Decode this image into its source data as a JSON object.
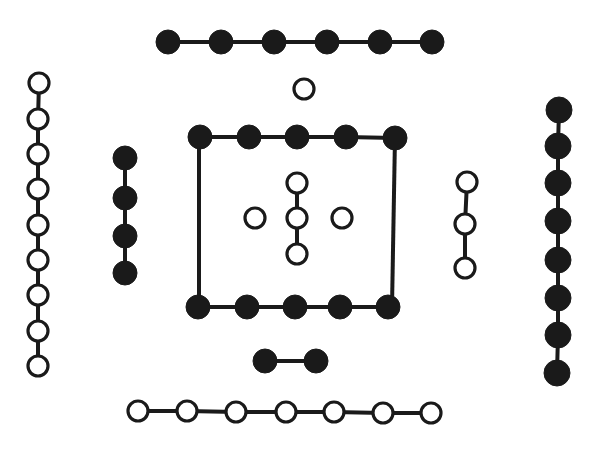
{
  "diagram": {
    "title": "",
    "style": {
      "ink": "#1a1a1a",
      "paper": "#ffffff"
    },
    "groups": [
      {
        "id": "top-row",
        "count": 6,
        "fill": "black",
        "orientation": "horizontal",
        "connected": true,
        "points": [
          [
            168,
            42
          ],
          [
            221,
            42
          ],
          [
            274,
            42
          ],
          [
            327,
            42
          ],
          [
            380,
            42
          ],
          [
            432,
            42
          ]
        ],
        "r": 12
      },
      {
        "id": "top-single",
        "count": 1,
        "fill": "white",
        "orientation": "single",
        "connected": false,
        "points": [
          [
            304,
            89
          ]
        ],
        "r": 10
      },
      {
        "id": "left-column",
        "count": 9,
        "fill": "white",
        "orientation": "vertical",
        "connected": true,
        "points": [
          [
            39,
            83
          ],
          [
            38,
            119
          ],
          [
            38,
            154
          ],
          [
            38,
            189
          ],
          [
            38,
            225
          ],
          [
            38,
            260
          ],
          [
            38,
            295
          ],
          [
            38,
            331
          ],
          [
            38,
            366
          ]
        ],
        "r": 10
      },
      {
        "id": "right-column",
        "count": 8,
        "fill": "black",
        "orientation": "vertical",
        "connected": true,
        "points": [
          [
            559,
            110
          ],
          [
            558,
            146
          ],
          [
            558,
            183
          ],
          [
            558,
            221
          ],
          [
            558,
            260
          ],
          [
            558,
            298
          ],
          [
            558,
            335
          ],
          [
            557,
            373
          ]
        ],
        "r": 13
      },
      {
        "id": "inner-left-column",
        "count": 4,
        "fill": "black",
        "orientation": "vertical",
        "connected": true,
        "points": [
          [
            125,
            158
          ],
          [
            125,
            198
          ],
          [
            125,
            236
          ],
          [
            125,
            273
          ]
        ],
        "r": 12
      },
      {
        "id": "inner-right-column",
        "count": 3,
        "fill": "white",
        "orientation": "vertical",
        "connected": true,
        "points": [
          [
            467,
            182
          ],
          [
            465,
            224
          ],
          [
            465,
            268
          ]
        ],
        "r": 10
      },
      {
        "id": "square-top",
        "count": 5,
        "fill": "black",
        "orientation": "horizontal",
        "connected": true,
        "points": [
          [
            200,
            137
          ],
          [
            249,
            137
          ],
          [
            297,
            137
          ],
          [
            346,
            137
          ],
          [
            395,
            138
          ]
        ],
        "r": 12
      },
      {
        "id": "square-bottom",
        "count": 5,
        "fill": "black",
        "orientation": "horizontal",
        "connected": true,
        "points": [
          [
            198,
            307
          ],
          [
            247,
            307
          ],
          [
            295,
            307
          ],
          [
            340,
            307
          ],
          [
            388,
            307
          ]
        ],
        "r": 12
      },
      {
        "id": "center-column",
        "count": 3,
        "fill": "white",
        "orientation": "vertical",
        "connected": true,
        "points": [
          [
            297,
            183
          ],
          [
            297,
            218
          ],
          [
            297,
            254
          ]
        ],
        "r": 10
      },
      {
        "id": "center-left-single",
        "count": 1,
        "fill": "white",
        "orientation": "single",
        "connected": false,
        "points": [
          [
            255,
            218
          ]
        ],
        "r": 10
      },
      {
        "id": "center-right-single",
        "count": 1,
        "fill": "white",
        "orientation": "single",
        "connected": false,
        "points": [
          [
            342,
            218
          ]
        ],
        "r": 10
      },
      {
        "id": "bottom-pair",
        "count": 2,
        "fill": "black",
        "orientation": "horizontal",
        "connected": true,
        "points": [
          [
            265,
            361
          ],
          [
            316,
            361
          ]
        ],
        "r": 12
      },
      {
        "id": "bottom-row",
        "count": 7,
        "fill": "white",
        "orientation": "horizontal",
        "connected": true,
        "points": [
          [
            138,
            411
          ],
          [
            187,
            411
          ],
          [
            236,
            412
          ],
          [
            286,
            412
          ],
          [
            334,
            412
          ],
          [
            383,
            413
          ],
          [
            431,
            413
          ]
        ],
        "r": 10
      }
    ],
    "square_frame": {
      "left_side": [
        [
          199,
          137
        ],
        [
          199,
          307
        ]
      ],
      "right_side": [
        [
          395,
          137
        ],
        [
          392,
          307
        ]
      ]
    }
  }
}
